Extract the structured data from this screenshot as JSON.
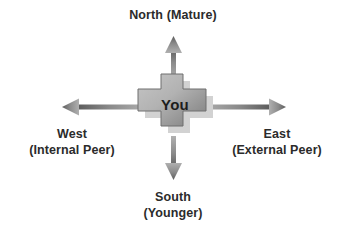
{
  "diagram": {
    "center": {
      "label": "You",
      "shape": "cross"
    },
    "directions": [
      {
        "id": "north",
        "name": "North",
        "qualifier": "(Mature)",
        "arrow": "arrow-up"
      },
      {
        "id": "east",
        "name": "East",
        "qualifier": "(External Peer)",
        "arrow": "arrow-right"
      },
      {
        "id": "south",
        "name": "South",
        "qualifier": "(Younger)",
        "arrow": "arrow-down"
      },
      {
        "id": "west",
        "name": "West",
        "qualifier": "(Internal Peer)",
        "arrow": "arrow-left"
      }
    ],
    "colors": {
      "background": "#ffffff",
      "text": "#2b2b2b",
      "center_text": "#1d1d1d",
      "shape_light": "#c2c2c2",
      "shape_dark": "#7e7e7e",
      "shape_outline": "#6f6f6f",
      "arrow_light": "#a9a9a9",
      "arrow_dark": "#5f5f5f",
      "shadow": "#cfcfcf"
    }
  }
}
